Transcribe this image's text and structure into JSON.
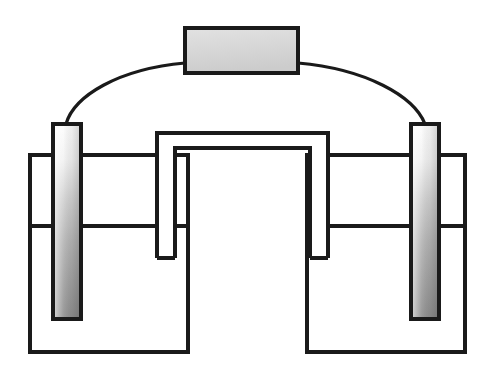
{
  "figure": {
    "type": "line-art-schematic",
    "width": 487,
    "height": 384,
    "background_color": "#ffffff",
    "stroke_color": "#1a1a1a",
    "stroke_width": 4
  },
  "palette": {
    "ink": "#1a1a1a",
    "meter_fill_light": "#e0e0e0",
    "meter_fill_dark": "#c9c9c9",
    "electrode_top": "#fdfdfd",
    "electrode_mid": "#c4c4c4",
    "electrode_bottom": "#8f8f8f",
    "electrode_shade_left": "#ffffff",
    "electrode_shade_right": "#9a9a9a",
    "beaker_fill": "#ffffff",
    "salt_bridge_fill": "#ffffff"
  },
  "components": {
    "meter": {
      "name": "meter-box",
      "label": "",
      "x": 185,
      "y": 28,
      "width": 113,
      "height": 45,
      "fill": "#d8d8d8",
      "stroke": "#1a1a1a"
    },
    "wire_left": {
      "name": "wire-left",
      "label": "",
      "path": "M 66 124 C 75 95, 120 68, 185 63",
      "stroke": "#1a1a1a",
      "stroke_width": 3
    },
    "wire_right": {
      "name": "wire-right",
      "label": "",
      "path": "M 298 63 C 365 68, 414 96, 425 124",
      "stroke": "#1a1a1a",
      "stroke_width": 3
    },
    "electrode_left": {
      "name": "electrode-left",
      "label": "",
      "x": 53,
      "y": 124,
      "width": 28,
      "height": 195
    },
    "electrode_right": {
      "name": "electrode-right",
      "label": "",
      "x": 411,
      "y": 124,
      "width": 28,
      "height": 195
    },
    "beaker_left": {
      "name": "beaker-left",
      "label": "",
      "x": 30,
      "y": 155,
      "width": 158,
      "height": 197,
      "liquid_level_y": 226
    },
    "beaker_right": {
      "name": "beaker-right",
      "label": "",
      "x": 307,
      "y": 155,
      "width": 158,
      "height": 197,
      "liquid_level_y": 226
    },
    "salt_bridge": {
      "name": "salt-bridge",
      "label": "",
      "outer_path": "M 157 258 L 157 133 L 328 133 L 328 258",
      "inner_path": "M 175 258 L 175 148 L 310 148 L 310 258",
      "left_leg_bottom": "M 157 258 L 175 258",
      "right_leg_bottom": "M 310 258 L 328 258",
      "top_outer_y": 133,
      "top_inner_y": 148,
      "bottom_y": 258
    }
  },
  "annotations": {
    "items": []
  }
}
